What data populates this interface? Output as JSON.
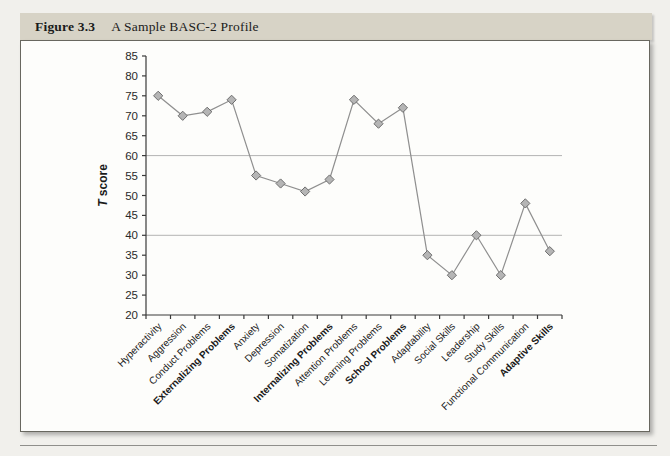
{
  "figure": {
    "label": "Figure 3.3",
    "title": "A Sample BASC-2 Profile"
  },
  "chart_data": {
    "type": "line",
    "title": "",
    "categories": [
      "Hyperactivity",
      "Aggression",
      "Conduct Problems",
      "Externalizing Problems",
      "Anxiety",
      "Depression",
      "Somatization",
      "Internalizing Problems",
      "Attention Problems",
      "Learning Problems",
      "School Problems",
      "Adaptability",
      "Social Skills",
      "Leadership",
      "Study Skills",
      "Functional Communication",
      "Adaptive Skills"
    ],
    "values": [
      75,
      70,
      71,
      74,
      55,
      53,
      51,
      54,
      74,
      68,
      72,
      35,
      30,
      40,
      30,
      48,
      36
    ],
    "bold_categories": [
      "Externalizing Problems",
      "Internalizing Problems",
      "School Problems",
      "Adaptive Skills"
    ],
    "xlabel": "",
    "ylabel": "T score",
    "ylabel_italic_first_letter": true,
    "ylim": [
      20,
      85
    ],
    "ytick_step": 5,
    "gridlines_at": [
      40,
      60
    ],
    "marker": "diamond",
    "legend": "none",
    "colors": {
      "line": "#8f8f8f",
      "marker_fill": "#b5b5b5",
      "marker_stroke": "#6e6e6e",
      "grid": "#b3b3b3",
      "axis": "#3a3a3a",
      "tick_text": "#2a2a2a"
    }
  }
}
